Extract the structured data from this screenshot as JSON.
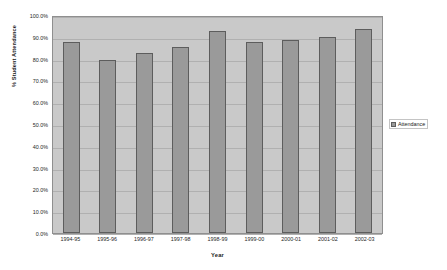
{
  "chart_data": {
    "type": "bar",
    "title": "",
    "xlabel": "Year",
    "ylabel": "% Student Attendance",
    "categories": [
      "1994-95",
      "1995-96",
      "1996-97",
      "1997-98",
      "1998-99",
      "1999-00",
      "2000-01",
      "2001-02",
      "2002-03"
    ],
    "series": [
      {
        "name": "Attendance",
        "values": [
          87.5,
          79.4,
          82.5,
          85.5,
          92.8,
          87.8,
          88.7,
          89.8,
          93.4
        ]
      }
    ],
    "ylim": [
      0,
      100
    ],
    "ytick_labels": [
      "0.0%",
      "10.0%",
      "20.0%",
      "30.0%",
      "40.0%",
      "50.0%",
      "60.0%",
      "70.0%",
      "80.0%",
      "90.0%",
      "100.0%"
    ],
    "ytick_values": [
      0,
      10,
      20,
      30,
      40,
      50,
      60,
      70,
      80,
      90,
      100
    ],
    "grid": true,
    "legend_position": "right",
    "colors": {
      "bar_fill": "#9a9a9a",
      "bar_border": "#5d5d5d",
      "plot_background": "#c9c9c9",
      "gridline": "#b0b0b0",
      "plot_border": "#8f8f8f",
      "figure_background": "#ffffff",
      "text": "#1b1b1b"
    }
  },
  "legend": {
    "entries": [
      {
        "label": "Attendance"
      }
    ]
  }
}
